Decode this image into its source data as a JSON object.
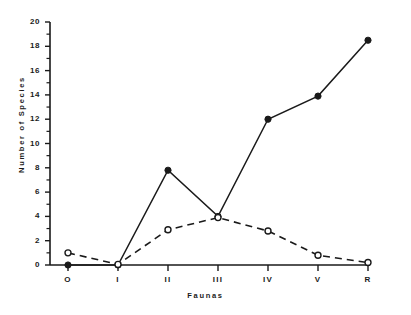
{
  "chart_data": {
    "type": "line",
    "title": "",
    "xlabel": "Faunas",
    "ylabel": "Number of Species",
    "categories": [
      "O",
      "I",
      "II",
      "III",
      "IV",
      "V",
      "R"
    ],
    "ylim": [
      0,
      20
    ],
    "yticks": [
      0,
      2,
      4,
      6,
      8,
      10,
      12,
      14,
      16,
      18,
      20
    ],
    "ytick_labels": [
      "0",
      "2",
      "4",
      "6",
      "8",
      "10",
      "12",
      "14",
      "16",
      "18",
      "20"
    ],
    "grid": false,
    "legend": "none",
    "series": [
      {
        "name": "solid-filled-circles",
        "style": "solid",
        "marker": "filled-circle",
        "color": "#1a1a1a",
        "values": [
          0,
          0,
          7.8,
          4.0,
          12.0,
          13.9,
          18.5
        ]
      },
      {
        "name": "dashed-open-circles",
        "style": "dashed",
        "marker": "open-circle",
        "color": "#1a1a1a",
        "values": [
          1.0,
          0.05,
          2.9,
          3.9,
          2.8,
          0.8,
          0.2
        ]
      }
    ]
  },
  "axes": {
    "y_title": "Number of Species",
    "x_title": "Faunas"
  }
}
